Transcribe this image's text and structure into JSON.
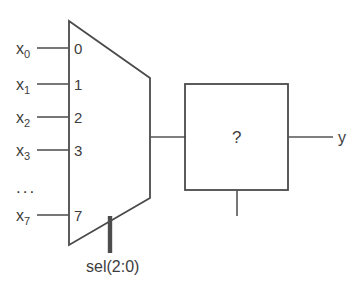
{
  "diagram": {
    "background_color": "#ffffff",
    "line_color": "#4a4a4a",
    "text_color": "#3d3d3d",
    "mux": {
      "name": "multiplexer",
      "inputs": [
        {
          "signal": "x",
          "subscript": "0",
          "port": "0"
        },
        {
          "signal": "x",
          "subscript": "1",
          "port": "1"
        },
        {
          "signal": "x",
          "subscript": "2",
          "port": "2"
        },
        {
          "signal": "x",
          "subscript": "3",
          "port": "3"
        },
        {
          "signal": "x",
          "subscript": "7",
          "port": "7"
        }
      ],
      "ellipsis": "...",
      "select": {
        "label": "sel(2:0)",
        "width_bits": "2:0"
      }
    },
    "block": {
      "label": "?",
      "name": "unknown-logic-block"
    },
    "output": {
      "label": "y"
    }
  }
}
